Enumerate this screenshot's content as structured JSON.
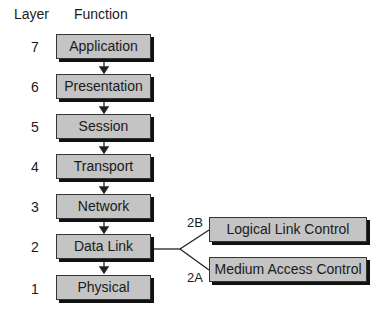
{
  "headers": {
    "layer": "Layer",
    "function": "Function"
  },
  "layers": [
    {
      "number": "7",
      "name": "Application"
    },
    {
      "number": "6",
      "name": "Presentation"
    },
    {
      "number": "5",
      "name": "Session"
    },
    {
      "number": "4",
      "name": "Transport"
    },
    {
      "number": "3",
      "name": "Network"
    },
    {
      "number": "2",
      "name": "Data Link"
    },
    {
      "number": "1",
      "name": "Physical"
    }
  ],
  "sublayers": [
    {
      "label": "2B",
      "name": "Logical Link Control"
    },
    {
      "label": "2A",
      "name": "Medium Access Control"
    }
  ],
  "colors": {
    "box_fill": "#c4c4c4",
    "shadow": "#111111"
  }
}
